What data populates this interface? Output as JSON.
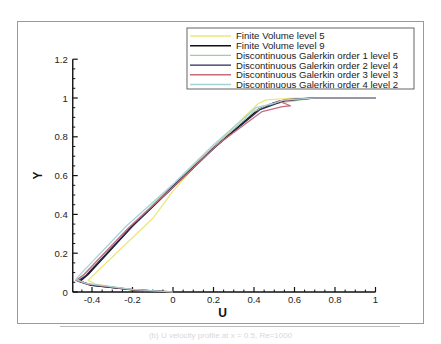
{
  "chart_data": {
    "type": "line",
    "title": "",
    "xlabel": "U",
    "ylabel": "Y",
    "xlim": [
      -0.5,
      1.0
    ],
    "ylim": [
      0,
      1.2
    ],
    "x_ticks": [
      "-0.4",
      "-0.2",
      "0",
      "0.2",
      "0.4",
      "0.6",
      "0.8",
      "1"
    ],
    "y_ticks": [
      "0",
      "0.2",
      "0.4",
      "0.6",
      "0.8",
      "1",
      "1.2"
    ],
    "grid": false,
    "legend_position": "top-right",
    "series": [
      {
        "name": "Finite Volume level 5",
        "color": "#e8e87a",
        "points": [
          [
            0,
            0
          ],
          [
            -0.2,
            0.01
          ],
          [
            -0.38,
            0.04
          ],
          [
            -0.42,
            0.06
          ],
          [
            -0.36,
            0.12
          ],
          [
            -0.1,
            0.38
          ],
          [
            0.0,
            0.52
          ],
          [
            0.1,
            0.64
          ],
          [
            0.25,
            0.8
          ],
          [
            0.42,
            0.97
          ],
          [
            0.46,
            0.99
          ],
          [
            0.6,
            1.0
          ],
          [
            1.0,
            1.0
          ]
        ]
      },
      {
        "name": "Finite Volume level 9",
        "color": "#111111",
        "points": [
          [
            0,
            0
          ],
          [
            -0.2,
            0.012
          ],
          [
            -0.4,
            0.035
          ],
          [
            -0.46,
            0.055
          ],
          [
            -0.42,
            0.09
          ],
          [
            -0.2,
            0.34
          ],
          [
            0.0,
            0.54
          ],
          [
            0.2,
            0.74
          ],
          [
            0.42,
            0.94
          ],
          [
            0.5,
            0.975
          ],
          [
            0.56,
            0.99
          ],
          [
            0.7,
            1.0
          ],
          [
            1.0,
            1.0
          ]
        ]
      },
      {
        "name": "Discontinuous Galerkin order 1 level 5",
        "color": "#a8c8a8",
        "points": [
          [
            0,
            0
          ],
          [
            -0.2,
            0.013
          ],
          [
            -0.42,
            0.04
          ],
          [
            -0.47,
            0.06
          ],
          [
            -0.43,
            0.1
          ],
          [
            -0.2,
            0.35
          ],
          [
            0.0,
            0.55
          ],
          [
            0.2,
            0.75
          ],
          [
            0.4,
            0.93
          ],
          [
            0.48,
            0.97
          ],
          [
            0.56,
            0.98
          ],
          [
            0.7,
            1.0
          ],
          [
            1.0,
            1.0
          ]
        ]
      },
      {
        "name": "Discontinuous Galerkin order 2 level 4",
        "color": "#2a2a5a",
        "points": [
          [
            0,
            0
          ],
          [
            -0.2,
            0.012
          ],
          [
            -0.41,
            0.035
          ],
          [
            -0.47,
            0.055
          ],
          [
            -0.43,
            0.085
          ],
          [
            -0.21,
            0.33
          ],
          [
            0.0,
            0.545
          ],
          [
            0.21,
            0.75
          ],
          [
            0.43,
            0.94
          ],
          [
            0.51,
            0.97
          ],
          [
            0.55,
            0.985
          ],
          [
            0.7,
            1.0
          ],
          [
            1.0,
            1.0
          ]
        ]
      },
      {
        "name": "Discontinuous Galerkin order 3 level 3",
        "color": "#c86a7a",
        "points": [
          [
            0,
            0
          ],
          [
            -0.2,
            0.012
          ],
          [
            -0.42,
            0.04
          ],
          [
            -0.48,
            0.06
          ],
          [
            -0.44,
            0.09
          ],
          [
            -0.22,
            0.33
          ],
          [
            0.0,
            0.54
          ],
          [
            0.22,
            0.76
          ],
          [
            0.44,
            0.93
          ],
          [
            0.54,
            0.955
          ],
          [
            0.58,
            0.96
          ],
          [
            0.52,
            0.985
          ],
          [
            0.7,
            1.0
          ],
          [
            1.0,
            1.0
          ]
        ]
      },
      {
        "name": "Discontinuous Galerkin order 4 level 2",
        "color": "#a8d0d8",
        "points": [
          [
            0,
            0
          ],
          [
            -0.2,
            0.014
          ],
          [
            -0.43,
            0.045
          ],
          [
            -0.48,
            0.065
          ],
          [
            -0.45,
            0.1
          ],
          [
            -0.23,
            0.34
          ],
          [
            0.0,
            0.555
          ],
          [
            0.2,
            0.76
          ],
          [
            0.41,
            0.95
          ],
          [
            0.49,
            0.97
          ],
          [
            0.55,
            0.99
          ],
          [
            0.7,
            1.0
          ],
          [
            1.0,
            1.0
          ]
        ]
      }
    ]
  },
  "caption": "(b) U velocity profile at x = 0.5, Re=1000"
}
